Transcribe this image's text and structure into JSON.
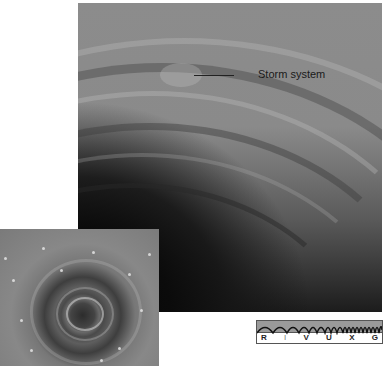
{
  "figure": {
    "main_image": {
      "description": "Saturn polar cloud bands, grayscale",
      "annotation": {
        "label": "Storm system"
      }
    },
    "inset_image": {
      "description": "Close-up of polar vortex, grayscale"
    },
    "spectrum_bar": {
      "bands": [
        "R",
        "I",
        "V",
        "U",
        "X",
        "G"
      ],
      "highlighted": "V"
    }
  }
}
